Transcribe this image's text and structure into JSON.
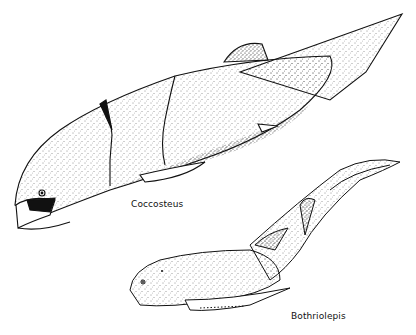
{
  "figure": {
    "type": "scientific illustration",
    "style": "black-and-white stipple drawing",
    "background": "#ffffff",
    "ink": "#111111"
  },
  "specimens": [
    {
      "name": "Coccosteus",
      "label": "Coccosteus",
      "position": "upper-left, large armored fish facing left"
    },
    {
      "name": "Bothriolepis",
      "label": "Bothriolepis",
      "position": "lower-right, smaller fish facing left, tail curving up-right"
    }
  ]
}
